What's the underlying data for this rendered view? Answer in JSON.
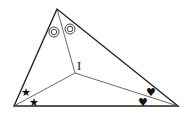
{
  "diagram": {
    "title": "",
    "incenter_label": "I",
    "markers": {
      "apex_angle": "double-circle",
      "left_angle": "star",
      "right_angle": "heart"
    },
    "glyphs": {
      "star": "★",
      "heart": "♥"
    },
    "colors": {
      "stroke": "#222222",
      "background": "#ffffff"
    }
  }
}
